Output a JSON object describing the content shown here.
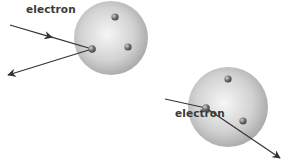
{
  "diagram": {
    "scenes": [
      {
        "label": "electron",
        "sphere": {
          "cx": 111,
          "cy": 38,
          "r": 37
        },
        "particles": [
          {
            "cx": 92,
            "cy": 49
          },
          {
            "cx": 115,
            "cy": 17
          },
          {
            "cx": 128,
            "cy": 47
          }
        ],
        "incoming": {
          "x1": 10,
          "y1": 25,
          "x2": 92,
          "y2": 49
        },
        "outgoing": {
          "x1": 92,
          "y1": 49,
          "x2": 8,
          "y2": 75
        }
      },
      {
        "label": "electron",
        "sphere": {
          "cx": 228,
          "cy": 107,
          "r": 40
        },
        "particles": [
          {
            "cx": 206,
            "cy": 108
          },
          {
            "cx": 228,
            "cy": 79
          },
          {
            "cx": 243,
            "cy": 121
          }
        ],
        "incoming": {
          "x1": 165,
          "y1": 99,
          "x2": 206,
          "y2": 108
        },
        "outgoing": {
          "x1": 206,
          "y1": 108,
          "x2": 280,
          "y2": 158
        }
      }
    ],
    "colors": {
      "sphere_light": "#f4f4f4",
      "sphere_dark": "#a8a8a8",
      "particle": "#6e6e6e",
      "arrow": "#333333"
    }
  }
}
